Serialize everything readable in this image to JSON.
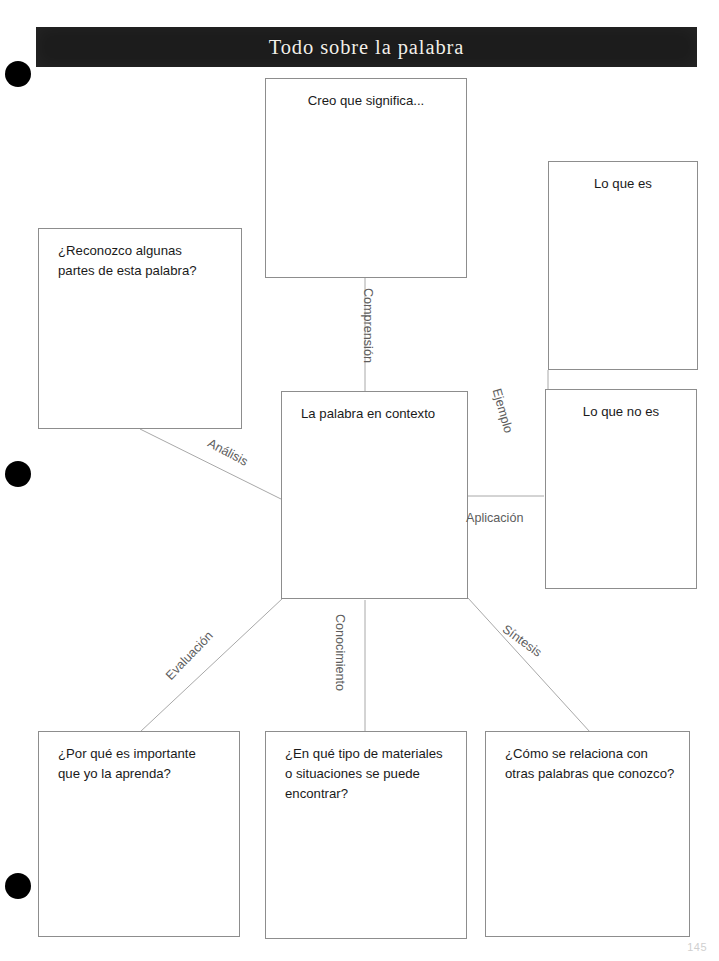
{
  "document": {
    "title": "Todo sobre la palabra",
    "page_number": "145",
    "ink_color": "#1a1a1a",
    "line_color": "#a8a8a8",
    "border_color": "#8d8d8d",
    "banner_color": "#1c1c1c",
    "banner_text_color": "#f2efe9",
    "edge_label_color": "#5d5d5d"
  },
  "center": {
    "label": "La palabra en contexto"
  },
  "boxes": [
    {
      "id": "creo-que-significa",
      "label": "Creo que significa...",
      "align": "center"
    },
    {
      "id": "reconozco-partes",
      "label": "¿Reconozco algunas\npartes de esta palabra?",
      "align": "left"
    },
    {
      "id": "lo-que-es",
      "label": "Lo que es",
      "align": "center"
    },
    {
      "id": "lo-que-no-es",
      "label": "Lo que no es",
      "align": "center"
    },
    {
      "id": "por-que-importante",
      "label": "¿Por qué es importante\nque yo la aprenda?",
      "align": "left"
    },
    {
      "id": "en-que-materiales",
      "label": "¿En qué tipo de materiales\no situaciones se puede\nencontrar?",
      "align": "left"
    },
    {
      "id": "como-se-relaciona",
      "label": "¿Cómo se relaciona con\notras palabras que conozco?",
      "align": "left"
    }
  ],
  "edge_labels": [
    {
      "id": "comprension",
      "label": "Comprensión"
    },
    {
      "id": "analisis",
      "label": "Análisis"
    },
    {
      "id": "ejemplo",
      "label": "Ejemplo"
    },
    {
      "id": "aplicacion",
      "label": "Aplicación"
    },
    {
      "id": "evaluacion",
      "label": "Evaluación"
    },
    {
      "id": "conocimiento",
      "label": "Conocimiento"
    },
    {
      "id": "sintesis",
      "label": "Síntesis"
    }
  ]
}
